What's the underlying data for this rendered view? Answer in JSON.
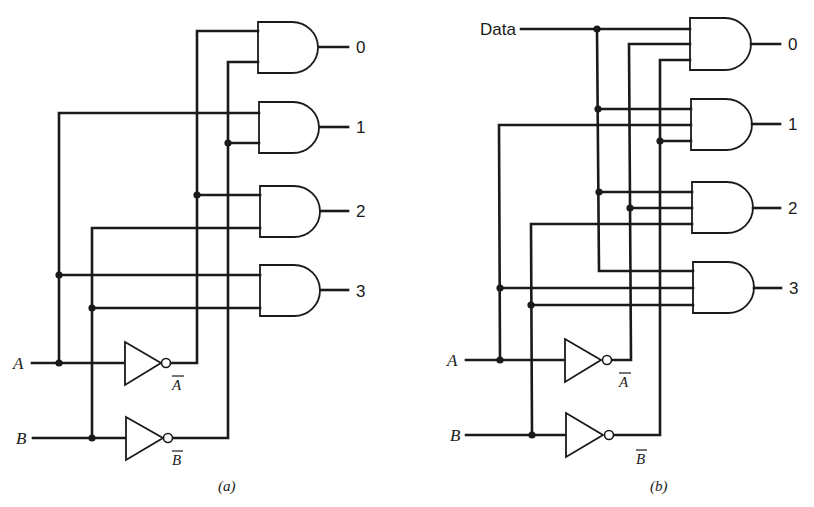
{
  "figure": {
    "panels": [
      {
        "id": "a",
        "caption": "(a)",
        "inputs": [
          "A",
          "B"
        ],
        "complements": [
          "A",
          "B"
        ],
        "outputs": [
          "0",
          "1",
          "2",
          "3"
        ],
        "gate_inputs": [
          [
            "A̅",
            "B̅"
          ],
          [
            "A",
            "B̅"
          ],
          [
            "A̅",
            "B"
          ],
          [
            "A",
            "B"
          ]
        ]
      },
      {
        "id": "b",
        "caption": "(b)",
        "data_label": "Data",
        "inputs": [
          "A",
          "B"
        ],
        "complements": [
          "A",
          "B"
        ],
        "outputs": [
          "0",
          "1",
          "2",
          "3"
        ],
        "gate_inputs": [
          [
            "Data",
            "A̅",
            "B̅"
          ],
          [
            "Data",
            "A",
            "B̅"
          ],
          [
            "Data",
            "A̅",
            "B"
          ],
          [
            "Data",
            "A",
            "B"
          ]
        ]
      }
    ],
    "colors": {
      "ink": "#1a1a1a",
      "paper": "#ffffff"
    }
  }
}
